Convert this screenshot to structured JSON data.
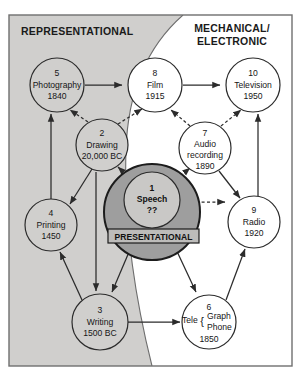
{
  "diagram": {
    "regions": [
      {
        "id": "representational",
        "label": "REPRESENTATIONAL",
        "fill": "#d0cfcd"
      },
      {
        "id": "mechanical-electronic",
        "label_line1": "MECHANICAL/",
        "label_line2": "ELECTRONIC",
        "fill": "#ffffff"
      }
    ],
    "center": {
      "outer_label": "PRESENTATIONAL",
      "outer_fill": "#9e9e9e",
      "inner_fill": "#c9c8c6",
      "number": "1",
      "name": "Speech",
      "date": "??"
    },
    "nodes": [
      {
        "id": "n5",
        "number": "5",
        "name": "Photography",
        "date": "1840",
        "cx": 57,
        "cy": 85,
        "r": 27
      },
      {
        "id": "n8",
        "number": "8",
        "name": "Film",
        "date": "1915",
        "cx": 155,
        "cy": 85,
        "r": 27
      },
      {
        "id": "n10",
        "number": "10",
        "name": "Television",
        "date": "1950",
        "cx": 253,
        "cy": 85,
        "r": 27
      },
      {
        "id": "n2",
        "number": "2",
        "name": "Drawing",
        "date": "20,000 BC",
        "cx": 102,
        "cy": 145,
        "r": 26
      },
      {
        "id": "n7",
        "number": "7",
        "name": "Audio",
        "name2": "recording",
        "date": "1890",
        "cx": 205,
        "cy": 148,
        "r": 26
      },
      {
        "id": "n4",
        "number": "4",
        "name": "Printing",
        "date": "1450",
        "cx": 51,
        "cy": 225,
        "r": 26
      },
      {
        "id": "n9",
        "number": "9",
        "name": "Radio",
        "date": "1920",
        "cx": 254,
        "cy": 222,
        "r": 26
      },
      {
        "id": "n3",
        "number": "3",
        "name": "Writing",
        "date": "1500 BC",
        "cx": 100,
        "cy": 322,
        "r": 28
      },
      {
        "id": "n6",
        "number": "6",
        "name_pre": "Tele",
        "name_a": "Graph",
        "name_b": "Phone",
        "date": "1850",
        "cx": 209,
        "cy": 322,
        "r": 27
      }
    ],
    "colors": {
      "stroke": "#2b2b2b",
      "region_gray": "#d0cfcd",
      "outer_circle_gray": "#9e9e9e",
      "inner_circle_gray": "#c9c8c6",
      "frame": "#6f6f6f"
    }
  }
}
